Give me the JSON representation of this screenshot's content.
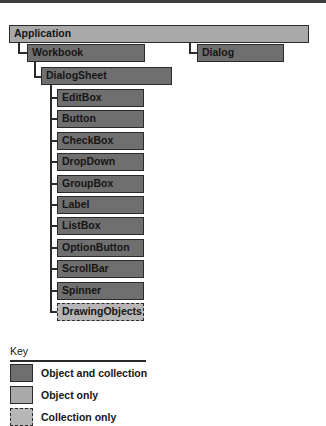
{
  "diagram": {
    "root": {
      "label": "Application",
      "type": "object-only"
    },
    "level1": [
      {
        "label": "Workbook",
        "type": "object-and-collection"
      },
      {
        "label": "Dialog",
        "type": "object-and-collection"
      }
    ],
    "level2": {
      "label": "DialogSheet",
      "type": "object-and-collection"
    },
    "controls": [
      {
        "label": "EditBox",
        "type": "object-and-collection"
      },
      {
        "label": "Button",
        "type": "object-and-collection"
      },
      {
        "label": "CheckBox",
        "type": "object-and-collection"
      },
      {
        "label": "DropDown",
        "type": "object-and-collection"
      },
      {
        "label": "GroupBox",
        "type": "object-and-collection"
      },
      {
        "label": "Label",
        "type": "object-and-collection"
      },
      {
        "label": "ListBox",
        "type": "object-and-collection"
      },
      {
        "label": "OptionButton",
        "type": "object-and-collection"
      },
      {
        "label": "ScrollBar",
        "type": "object-and-collection"
      },
      {
        "label": "Spinner",
        "type": "object-and-collection"
      },
      {
        "label": "DrawingObjects",
        "type": "collection-only"
      }
    ]
  },
  "key": {
    "title": "Key",
    "items": [
      {
        "label": "Object and collection",
        "style": "dark"
      },
      {
        "label": "Object only",
        "style": "light"
      },
      {
        "label": "Collection only",
        "style": "dashed"
      }
    ]
  },
  "colors": {
    "object_and_collection": "#6f6f6f",
    "object_only": "#a9a9a9",
    "collection_only": "#b6b6b6",
    "border": "#2a2a2a"
  }
}
